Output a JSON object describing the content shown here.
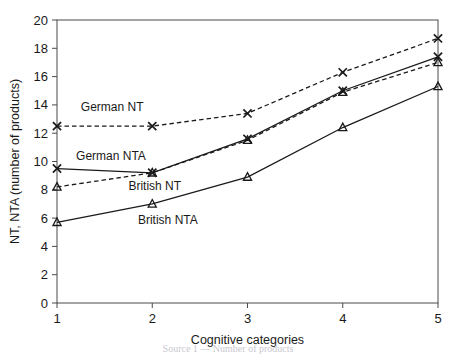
{
  "chart_data": {
    "type": "line",
    "title": "",
    "xlabel": "Cognitive categories",
    "ylabel": "NT, NTA (number of products)",
    "x": [
      1,
      2,
      3,
      4,
      5
    ],
    "xlim": [
      1,
      5
    ],
    "ylim": [
      0,
      20
    ],
    "xticks": [
      "1",
      "2",
      "3",
      "4",
      "5"
    ],
    "yticks": [
      "0",
      "2",
      "4",
      "6",
      "8",
      "10",
      "12",
      "14",
      "16",
      "18",
      "20"
    ],
    "grid": false,
    "legend_position": "inline-annotations",
    "series": [
      {
        "name": "German NT",
        "values": [
          12.5,
          12.5,
          13.4,
          16.3,
          18.7
        ],
        "line_style": "dashed",
        "marker": "x",
        "label_x": 1.25,
        "label_y": 13.6
      },
      {
        "name": "German NTA",
        "values": [
          9.5,
          9.2,
          11.6,
          15.0,
          17.4
        ],
        "line_style": "solid",
        "marker": "x",
        "label_x": 1.2,
        "label_y": 10.1
      },
      {
        "name": "British NT",
        "values": [
          8.2,
          9.2,
          11.5,
          14.9,
          17.0
        ],
        "line_style": "dashed",
        "marker": "triangle",
        "label_x": 1.75,
        "label_y": 8.0
      },
      {
        "name": "British NTA",
        "values": [
          5.7,
          7.0,
          8.9,
          12.4,
          15.3
        ],
        "line_style": "solid",
        "marker": "triangle",
        "label_x": 1.85,
        "label_y": 5.6
      }
    ]
  },
  "caption": {
    "ghost_text": "Source 1 — Number of products"
  }
}
